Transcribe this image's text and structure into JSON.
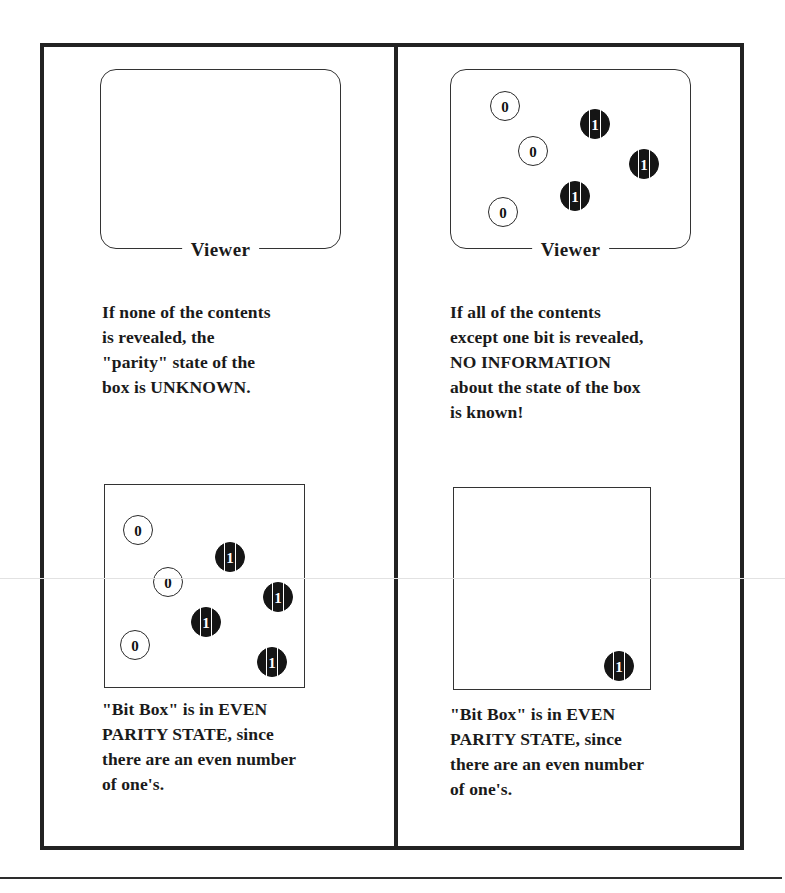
{
  "page": {
    "background_color": "#ffffff",
    "frame_color": "#222222",
    "ink_color": "#1a1a1a"
  },
  "viewer_label": "Viewer",
  "left_column": {
    "viewer": {
      "label": "Viewer",
      "bits": []
    },
    "caption": "If none of the contents\nis revealed, the\n\"parity\" state of the\nbox is UNKNOWN.",
    "bitbox": {
      "bits": [
        {
          "value": "0",
          "x": 18,
          "y": 30
        },
        {
          "value": "1",
          "x": 110,
          "y": 57
        },
        {
          "value": "0",
          "x": 48,
          "y": 82
        },
        {
          "value": "1",
          "x": 158,
          "y": 97
        },
        {
          "value": "1",
          "x": 86,
          "y": 122
        },
        {
          "value": "0",
          "x": 15,
          "y": 145
        },
        {
          "value": "1",
          "x": 152,
          "y": 162
        }
      ],
      "zero_count": 3,
      "one_count": 4
    },
    "bitbox_caption": "\"Bit Box\" is in EVEN\nPARITY STATE, since\nthere are an even number\nof one's."
  },
  "right_column": {
    "viewer": {
      "label": "Viewer",
      "bits": [
        {
          "value": "0",
          "x": 40,
          "y": 22
        },
        {
          "value": "1",
          "x": 130,
          "y": 40
        },
        {
          "value": "0",
          "x": 68,
          "y": 67
        },
        {
          "value": "1",
          "x": 179,
          "y": 80
        },
        {
          "value": "1",
          "x": 110,
          "y": 112
        },
        {
          "value": "0",
          "x": 38,
          "y": 128
        }
      ],
      "zero_count": 3,
      "one_count": 3
    },
    "caption": "If all of the contents\nexcept one bit is revealed,\nNO INFORMATION\nabout the state of the box\nis known!",
    "bitbox": {
      "bits": [
        {
          "value": "1",
          "x": 150,
          "y": 163
        }
      ],
      "zero_count": 0,
      "one_count": 1
    },
    "bitbox_caption": "\"Bit Box\" is in EVEN\nPARITY STATE, since\nthere are an even number\nof one's."
  }
}
